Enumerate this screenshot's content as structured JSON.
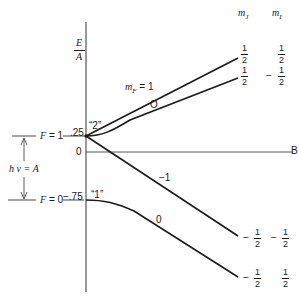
{
  "axis": {
    "y_label_num": "E",
    "y_label_den": "A",
    "tick_025": ".25",
    "tick_0": "0",
    "tick_m075": "−.75",
    "b_label": "B"
  },
  "levels": {
    "f1_label": "F = 1",
    "f0_label": "F = 0",
    "transition_label": "h ν = A",
    "state2_label": "“2”",
    "state1_label": "“1”"
  },
  "lines": {
    "mf_label": "m",
    "mf_sub": "F",
    "mf_value": " = 1",
    "upper_curve_label": "O",
    "minus1_label": "−1",
    "lower_curve_label": "0"
  },
  "columns": {
    "mj_header": "m",
    "mj_sub": "J",
    "mi_header": "m",
    "mi_sub": "I"
  },
  "rows": [
    {
      "mj_sign": "",
      "mj_num": "1",
      "mj_den": "2",
      "mi_sign": "",
      "mi_num": "1",
      "mi_den": "2"
    },
    {
      "mj_sign": "",
      "mj_num": "1",
      "mj_den": "2",
      "mi_sign": "−",
      "mi_num": "1",
      "mi_den": "2"
    },
    {
      "mj_sign": "−",
      "mj_num": "1",
      "mj_den": "2",
      "mi_sign": "−",
      "mi_num": "1",
      "mi_den": "2"
    },
    {
      "mj_sign": "−",
      "mj_num": "1",
      "mj_den": "2",
      "mi_sign": "",
      "mi_num": "1",
      "mi_den": "2"
    }
  ],
  "colors": {
    "ink": "#1a1a1a",
    "axis": "#555555"
  }
}
